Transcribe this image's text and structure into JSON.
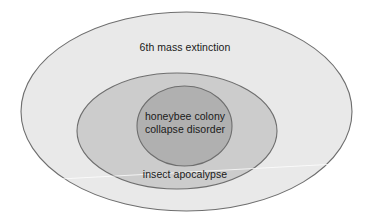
{
  "diagram": {
    "type": "nested-euler-venn",
    "background_color": "#ffffff",
    "regions": [
      {
        "key": "outer",
        "name": "6th mass extinction",
        "label": "6th mass extinction",
        "fill_color": "#e9e9e9",
        "stroke_color": "#6e6e6e",
        "shape": "ellipse"
      },
      {
        "key": "middle",
        "name": "insect apocalypse",
        "label": "insect apocalypse",
        "fill_color": "#cccccc",
        "stroke_color": "#6e6e6e",
        "shape": "ellipse"
      },
      {
        "key": "inner",
        "name": "honeybee colony collapse disorder",
        "label_line_1": "honeybee colony",
        "label_line_2": "collapse disorder",
        "fill_color": "#b0b0b0",
        "stroke_color": "#6e6e6e",
        "shape": "ellipse"
      }
    ]
  },
  "labels": {
    "outer": "6th mass extinction",
    "middle": "insect apocalypse",
    "inner_line_1": "honeybee colony",
    "inner_line_2": "collapse disorder"
  }
}
